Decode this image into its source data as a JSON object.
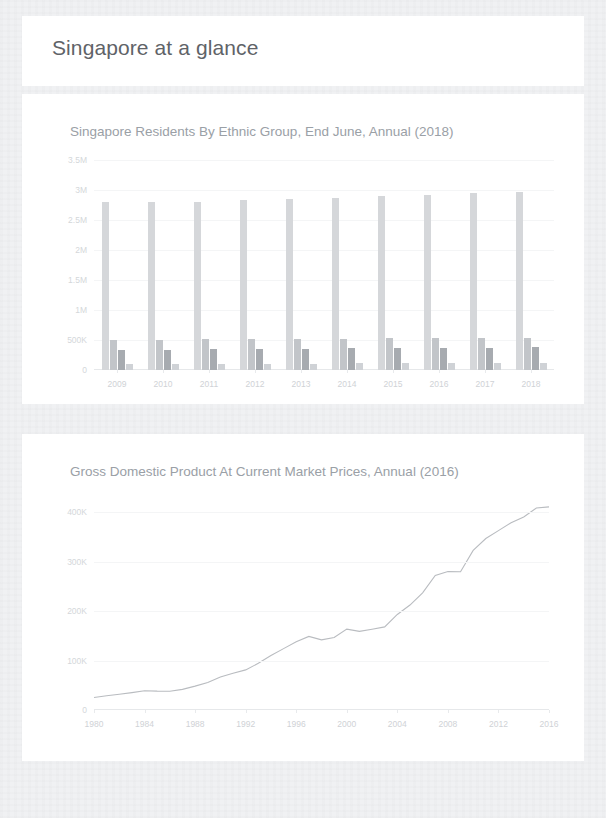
{
  "page": {
    "title": "Singapore at a glance",
    "background_color": "#f1f2f4",
    "card_color": "#ffffff",
    "title_color": "#5f6368"
  },
  "charts": [
    {
      "id": "residents-by-ethnic-group",
      "title": "Singapore Residents By Ethnic Group, End June, Annual (2018)",
      "chart_data": {
        "type": "bar",
        "title": "Singapore Residents By Ethnic Group, End June, Annual (2018)",
        "xlabel": "",
        "ylabel": "",
        "ylim": [
          0,
          3500000
        ],
        "grid": true,
        "legend": "none",
        "ytick_labels": [
          "3.5M",
          "3M",
          "2.5M",
          "2M",
          "1.5M",
          "1M",
          "500K",
          "0"
        ],
        "ytick_values": [
          3500000,
          3000000,
          2500000,
          2000000,
          1500000,
          1000000,
          500000,
          0
        ],
        "categories": [
          "2009",
          "2010",
          "2011",
          "2012",
          "2013",
          "2014",
          "2015",
          "2016",
          "2017",
          "2018"
        ],
        "series": [
          {
            "name": "Chinese",
            "color": "#d5d7da",
            "values": [
              2794000,
              2793900,
              2808000,
              2830000,
              2855000,
              2875000,
              2899000,
              2921000,
              2943000,
              2963000
            ]
          },
          {
            "name": "Malays",
            "color": "#c2c5c9",
            "values": [
              496000,
              503900,
              509000,
              515000,
              520000,
              525000,
              529000,
              533000,
              537000,
              541000
            ]
          },
          {
            "name": "Indians",
            "color": "#a7abb0",
            "values": [
              330000,
              337000,
              345000,
              352000,
              358000,
              363000,
              367000,
              370000,
              373000,
              376000
            ]
          },
          {
            "name": "Others",
            "color": "#cfd2d6",
            "values": [
              100000,
              102000,
              104000,
              106000,
              108000,
              110000,
              112000,
              114000,
              116000,
              118000
            ]
          }
        ]
      }
    },
    {
      "id": "gdp-current-market-prices",
      "title": "Gross Domestic Product At Current Market Prices, Annual (2016)",
      "chart_data": {
        "type": "line",
        "title": "Gross Domestic Product At Current Market Prices, Annual (2016)",
        "xlabel": "",
        "ylabel": "",
        "ylim": [
          0,
          400000
        ],
        "grid": true,
        "legend": "none",
        "line_color": "#b9bcc0",
        "ytick_labels": [
          "400K",
          "300K",
          "200K",
          "100K",
          "0"
        ],
        "ytick_values": [
          400000,
          300000,
          200000,
          100000,
          0
        ],
        "xtick_labels": [
          "1980",
          "1984",
          "1988",
          "1992",
          "1996",
          "2000",
          "2004",
          "2008",
          "2012",
          "2016"
        ],
        "x": [
          1980,
          1981,
          1982,
          1983,
          1984,
          1985,
          1986,
          1987,
          1988,
          1989,
          1990,
          1991,
          1992,
          1993,
          1994,
          1995,
          1996,
          1997,
          1998,
          1999,
          2000,
          2001,
          2002,
          2003,
          2004,
          2005,
          2006,
          2007,
          2008,
          2009,
          2010,
          2011,
          2012,
          2013,
          2014,
          2015,
          2016
        ],
        "values": [
          25091,
          28833,
          31870,
          35153,
          38924,
          38062,
          37897,
          41624,
          48191,
          55602,
          66778,
          74306,
          81056,
          94345,
          110123,
          123995,
          137757,
          148744,
          141671,
          146584,
          163397,
          158940,
          163189,
          167870,
          193057,
          212014,
          236643,
          271903,
          279927,
          279343,
          322361,
          346353,
          362332,
          378200,
          390089,
          408052,
          410270
        ]
      }
    }
  ]
}
